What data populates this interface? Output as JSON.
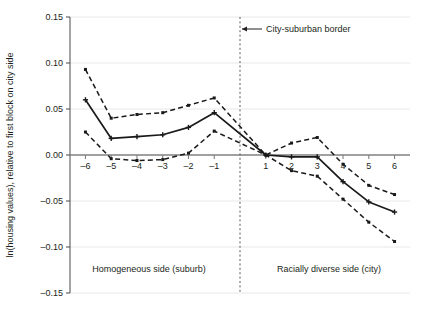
{
  "figure": {
    "background": "#ffffff",
    "line_color": "#1a1a1a",
    "grid_color": "#e8e8ea",
    "axis_color": "#808084",
    "border_color": "#58585b"
  },
  "axes": {
    "ylabel": "ln(housing values), relative to first block on city side",
    "ytick_labels": [
      "0.15",
      "0.10",
      "0.05",
      "0.00",
      "–0.05",
      "–0.10",
      "–0.15"
    ],
    "xtick_labels": [
      "–6",
      "–5",
      "–4",
      "–3",
      "–2",
      "–1",
      "1",
      "2",
      "3",
      "4",
      "5",
      "6"
    ]
  },
  "annotations": {
    "border_label": "City-suburban border",
    "left_region_label": "Homogeneous side (suburb)",
    "right_region_label": "Racially diverse side (city)"
  },
  "chart_data": {
    "type": "line",
    "title": "",
    "xlabel": "",
    "ylabel": "ln(housing values), relative to first block on city side",
    "xlim": [
      -6.6,
      6.6
    ],
    "ylim": [
      -0.15,
      0.15
    ],
    "yticks": [
      0.15,
      0.1,
      0.05,
      0.0,
      -0.05,
      -0.1,
      -0.15
    ],
    "xticks": [
      -6,
      -5,
      -4,
      -3,
      -2,
      -1,
      1,
      2,
      3,
      4,
      5,
      6
    ],
    "grid": true,
    "legend": "none",
    "vline_x": 0,
    "vline_style": "dotted",
    "x": [
      -6,
      -5,
      -4,
      -3,
      -2,
      -1,
      1,
      2,
      3,
      4,
      5,
      6
    ],
    "series": [
      {
        "name": "upper confidence bound",
        "style": "dashed",
        "marker": "square",
        "values": [
          0.093,
          0.04,
          0.044,
          0.046,
          0.054,
          0.062,
          0.0,
          0.013,
          0.019,
          -0.01,
          -0.033,
          -0.043
        ]
      },
      {
        "name": "point estimate",
        "style": "solid",
        "marker": "plus",
        "values": [
          0.06,
          0.018,
          0.02,
          0.022,
          0.03,
          0.046,
          0.0,
          -0.002,
          -0.002,
          -0.029,
          -0.051,
          -0.062
        ]
      },
      {
        "name": "lower confidence bound",
        "style": "dashed",
        "marker": "square",
        "values": [
          0.025,
          -0.004,
          -0.006,
          -0.005,
          0.002,
          0.026,
          0.0,
          -0.017,
          -0.023,
          -0.048,
          -0.073,
          -0.094
        ]
      }
    ]
  }
}
